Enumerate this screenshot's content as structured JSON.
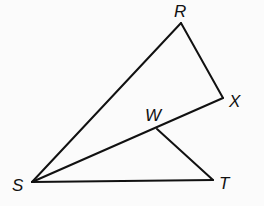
{
  "diagram": {
    "points": {
      "R": {
        "label": "R",
        "x": 181,
        "y": 23,
        "lx": 174,
        "ly": 17
      },
      "X": {
        "label": "X",
        "x": 223,
        "y": 98,
        "lx": 229,
        "ly": 107
      },
      "W": {
        "label": "W",
        "x": 157,
        "y": 129,
        "lx": 145,
        "ly": 121
      },
      "S": {
        "label": "S",
        "x": 32,
        "y": 182,
        "lx": 12,
        "ly": 191
      },
      "T": {
        "label": "T",
        "x": 213,
        "y": 180,
        "lx": 219,
        "ly": 189
      }
    },
    "segments": [
      [
        "S",
        "R"
      ],
      [
        "R",
        "X"
      ],
      [
        "X",
        "S"
      ],
      [
        "W",
        "T"
      ],
      [
        "S",
        "T"
      ]
    ],
    "stroke_color": "#111111"
  }
}
